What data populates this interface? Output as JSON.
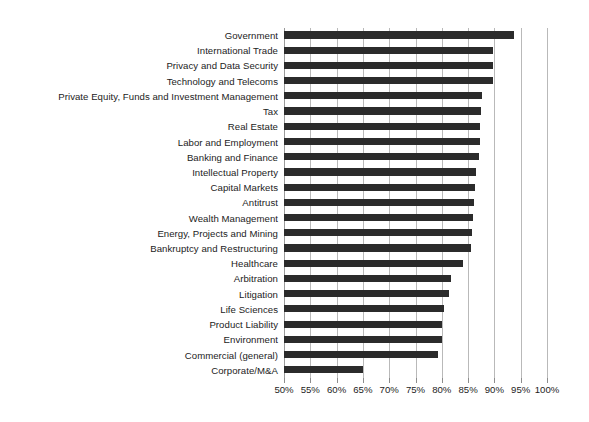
{
  "chart_data": {
    "type": "bar",
    "orientation": "horizontal",
    "title": "",
    "subtitle": "",
    "xlabel": "",
    "ylabel": "",
    "xlim": [
      50,
      100
    ],
    "ylim": null,
    "grid": true,
    "legend": null,
    "legend_position": "none",
    "xtick_labels": [
      "50%",
      "55%",
      "60%",
      "65%",
      "70%",
      "75%",
      "80%",
      "85%",
      "90%",
      "95%",
      "100%"
    ],
    "xtick_values": [
      50,
      55,
      60,
      65,
      70,
      75,
      80,
      85,
      90,
      95,
      100
    ],
    "bar_color": "#2b2b2b",
    "gridline_color": "#b9b9b9",
    "background_color": "#ffffff",
    "units": "percent",
    "categories": [
      "Government",
      "International Trade",
      "Privacy and Data Security",
      "Technology and Telecoms",
      "Private Equity, Funds and Investment Management",
      "Tax",
      "Real Estate",
      "Labor and Employment",
      "Banking and Finance",
      "Intellectual Property",
      "Capital Markets",
      "Antitrust",
      "Wealth Management",
      "Energy, Projects and Mining",
      "Bankruptcy and Restructuring",
      "Healthcare",
      "Arbitration",
      "Litigation",
      "Life Sciences",
      "Product Liability",
      "Environment",
      "Commercial (general)",
      "Corporate/M&A"
    ],
    "values": [
      93.7,
      89.8,
      89.8,
      89.8,
      87.7,
      87.5,
      87.3,
      87.2,
      87.0,
      86.5,
      86.3,
      86.2,
      86.0,
      85.8,
      85.5,
      84.0,
      81.8,
      81.4,
      80.5,
      80.0,
      80.0,
      79.3,
      65.0
    ]
  }
}
